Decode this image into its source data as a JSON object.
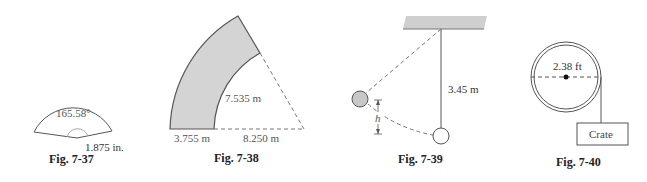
{
  "figures": [
    {
      "id": "fig-7-37",
      "caption": "Fig. 7-37",
      "description": "Circular sector with central angle",
      "labels": {
        "angle": "165.58°",
        "radius": "1.875 in."
      }
    },
    {
      "id": "fig-7-38",
      "caption": "Fig. 7-38",
      "description": "Shaded annular sector (road curve) with dashed triangle",
      "labels": {
        "width": "3.755 m",
        "inner_arc": "7.535 m",
        "inner_radius": "8.250 m"
      }
    },
    {
      "id": "fig-7-39",
      "caption": "Fig. 7-39",
      "description": "Pendulum hung from ceiling, displaced bob rising height h",
      "labels": {
        "length": "3.45 m",
        "height": "h"
      }
    },
    {
      "id": "fig-7-40",
      "caption": "Fig. 7-40",
      "description": "Pulley wheel with rope lowering a crate",
      "labels": {
        "diameter": "2.38 ft",
        "crate": "Crate"
      }
    }
  ],
  "colors": {
    "line": "#555555",
    "shade": "#d4d4d4",
    "text": "#555555",
    "caption": "#222222"
  }
}
